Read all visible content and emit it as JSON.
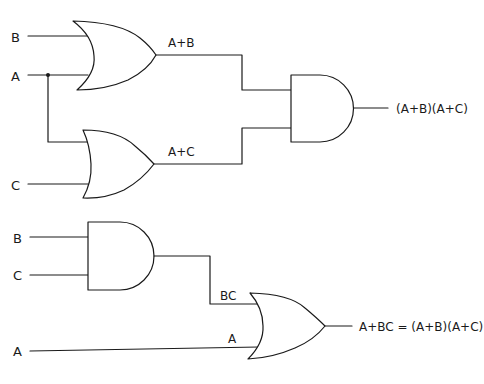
{
  "diagram": {
    "stroke_color": "#1a1a1a",
    "background": "#ffffff",
    "top_circuit": {
      "inputs": [
        {
          "label": "B"
        },
        {
          "label": "A"
        },
        {
          "label": "C"
        }
      ],
      "gates": [
        {
          "type": "OR",
          "output_label": "A+B"
        },
        {
          "type": "OR",
          "output_label": "A+C"
        },
        {
          "type": "AND",
          "output_label": "(A+B)(A+C)"
        }
      ]
    },
    "bottom_circuit": {
      "inputs": [
        {
          "label": "B"
        },
        {
          "label": "C"
        },
        {
          "label": "A"
        }
      ],
      "gates": [
        {
          "type": "AND",
          "output_label": "BC"
        },
        {
          "type": "OR",
          "input_label": "A",
          "output_label": "A+BC = (A+B)(A+C)"
        }
      ]
    }
  }
}
